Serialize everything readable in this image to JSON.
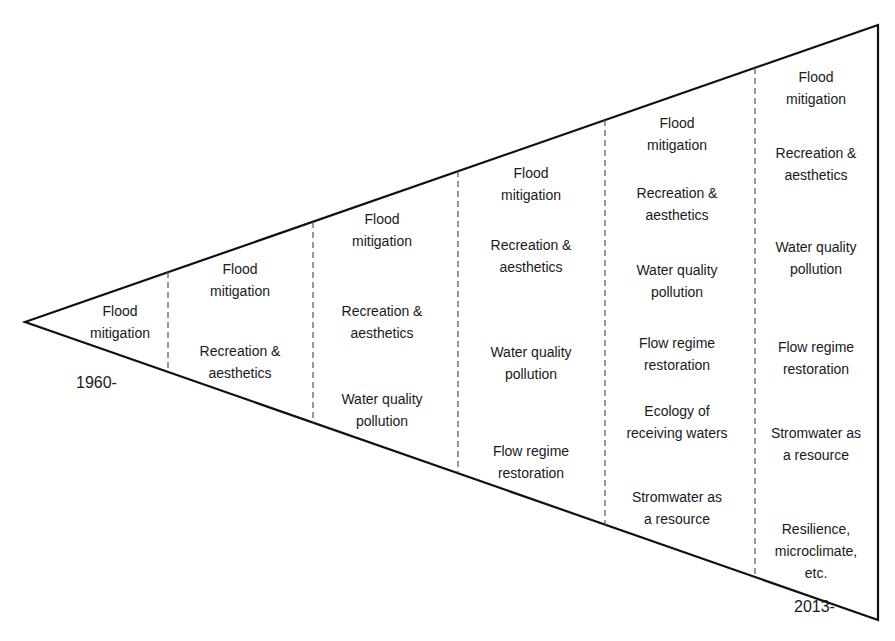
{
  "diagram": {
    "type": "expanding-wedge",
    "start_label": "1960-",
    "end_label": "2013-",
    "stages": [
      {
        "items": [
          "Flood\nmitigation"
        ]
      },
      {
        "items": [
          "Flood\nmitigation",
          "Recreation &\naesthetics"
        ]
      },
      {
        "items": [
          "Flood\nmitigation",
          "Recreation &\naesthetics",
          "Water quality\npollution"
        ]
      },
      {
        "items": [
          "Flood\nmitigation",
          "Recreation &\naesthetics",
          "Water quality\npollution",
          "Flow regime\nrestoration"
        ]
      },
      {
        "items": [
          "Flood\nmitigation",
          "Recreation &\naesthetics",
          "Water quality\npollution",
          "Flow regime\nrestoration",
          "Ecology of\nreceiving waters",
          "Stromwater as\na resource"
        ]
      },
      {
        "items": [
          "Flood\nmitigation",
          "Recreation &\naesthetics",
          "Water quality\npollution",
          "Flow regime\nrestoration",
          "Stromwater as\na resource",
          "Resilience,\nmicroclimate,\netc."
        ]
      }
    ]
  }
}
